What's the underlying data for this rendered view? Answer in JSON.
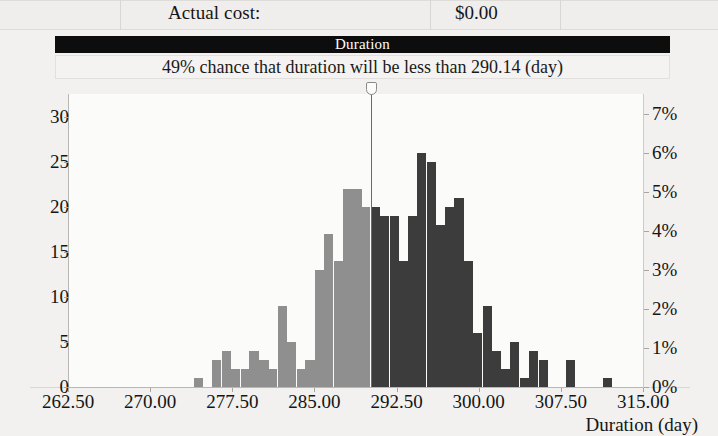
{
  "header": {
    "cost_label": "Actual cost:",
    "cost_value": "$0.00"
  },
  "title_bar": {
    "title": "Duration"
  },
  "subtitle": {
    "text": "49% chance that duration will be less than 290.14 (day)"
  },
  "marker": {
    "value": 290.14,
    "handle_icon": "slider-handle-icon"
  },
  "chart_data": {
    "type": "bar",
    "title": "Duration",
    "subtitle": "49% chance that duration will be less than 290.14 (day)",
    "xlabel": "Duration (day)",
    "ylabel": "",
    "ylabel_right": "",
    "xlim": [
      262.5,
      315.0
    ],
    "ylim": [
      0,
      32.5
    ],
    "ylim_right": [
      0,
      7.5
    ],
    "xticks": [
      "262.50",
      "270.00",
      "277.50",
      "285.00",
      "292.50",
      "300.00",
      "307.50",
      "315.00"
    ],
    "xtick_values": [
      262.5,
      270.0,
      277.5,
      285.0,
      292.5,
      300.0,
      307.5,
      315.0
    ],
    "yticks": [
      "0",
      "5",
      "10",
      "15",
      "20",
      "25",
      "30"
    ],
    "ytick_values": [
      0,
      5,
      10,
      15,
      20,
      25,
      30
    ],
    "yticks_right": [
      "0%",
      "1%",
      "2%",
      "3%",
      "4%",
      "5%",
      "6%",
      "7%"
    ],
    "ytick_right_values": [
      0,
      1,
      2,
      3,
      4,
      5,
      6,
      7
    ],
    "grid": false,
    "legend": "none",
    "bin_width": 0.85,
    "color_below_marker": "#8f8f8f",
    "color_above_marker": "#3c3c3c",
    "marker_x": 290.14,
    "bins": [
      {
        "x": 274.3,
        "value": 1
      },
      {
        "x": 276.0,
        "value": 3
      },
      {
        "x": 276.9,
        "value": 4
      },
      {
        "x": 277.7,
        "value": 2
      },
      {
        "x": 278.6,
        "value": 2
      },
      {
        "x": 279.4,
        "value": 4
      },
      {
        "x": 280.3,
        "value": 3
      },
      {
        "x": 281.1,
        "value": 2
      },
      {
        "x": 282.0,
        "value": 9
      },
      {
        "x": 282.8,
        "value": 5
      },
      {
        "x": 283.7,
        "value": 2
      },
      {
        "x": 284.5,
        "value": 3
      },
      {
        "x": 285.4,
        "value": 13
      },
      {
        "x": 286.2,
        "value": 17
      },
      {
        "x": 287.1,
        "value": 14
      },
      {
        "x": 287.9,
        "value": 22
      },
      {
        "x": 288.8,
        "value": 22
      },
      {
        "x": 289.6,
        "value": 20
      },
      {
        "x": 290.5,
        "value": 20
      },
      {
        "x": 291.3,
        "value": 19
      },
      {
        "x": 292.2,
        "value": 19
      },
      {
        "x": 293.0,
        "value": 14
      },
      {
        "x": 293.9,
        "value": 19
      },
      {
        "x": 294.7,
        "value": 26
      },
      {
        "x": 295.6,
        "value": 25
      },
      {
        "x": 296.4,
        "value": 18
      },
      {
        "x": 297.3,
        "value": 20
      },
      {
        "x": 298.1,
        "value": 21
      },
      {
        "x": 299.0,
        "value": 14
      },
      {
        "x": 299.8,
        "value": 6
      },
      {
        "x": 300.7,
        "value": 9
      },
      {
        "x": 301.5,
        "value": 4
      },
      {
        "x": 302.4,
        "value": 2
      },
      {
        "x": 303.2,
        "value": 5
      },
      {
        "x": 304.1,
        "value": 1
      },
      {
        "x": 304.9,
        "value": 4
      },
      {
        "x": 305.8,
        "value": 3
      },
      {
        "x": 308.3,
        "value": 3
      },
      {
        "x": 311.7,
        "value": 1
      }
    ]
  }
}
